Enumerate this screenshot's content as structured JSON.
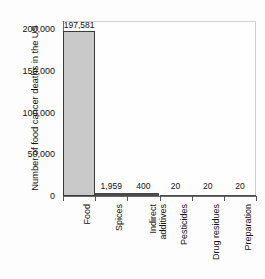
{
  "chart_data": {
    "type": "bar",
    "title": "",
    "subtitle": "",
    "xlabel": "",
    "ylabel": "Number of food cancer deaths in the US",
    "categories": [
      "Food",
      "Spices",
      "Indirect additives",
      "Pesticides",
      "Drug residues",
      "Preparation"
    ],
    "values": [
      197581,
      1959,
      400,
      20,
      20,
      20
    ],
    "value_labels": [
      "197,581",
      "1,959",
      "400",
      "20",
      "20",
      "20"
    ],
    "ylim": [
      0,
      210000
    ],
    "yticks": [
      0,
      50000,
      100000,
      150000,
      200000
    ],
    "ytick_labels": [
      "0",
      "50,000",
      "100,000",
      "150,000",
      "200,000"
    ],
    "grid": false,
    "legend": "none",
    "colors": {
      "bar_fill": "#c9c9c9",
      "bar_edge": "#3a3a3a",
      "thin_bar": "#4a4a4a",
      "axis": "#6a6a6a",
      "plot_border": "#cfcfcf",
      "text": "#111111",
      "background": "#fdfdfd"
    }
  },
  "axis": {
    "y_title": "Number of food cancer deaths in the US"
  },
  "category_label_lines": [
    [
      "Food"
    ],
    [
      "Spices"
    ],
    [
      "Indirect",
      "additives"
    ],
    [
      "Pesticides"
    ],
    [
      "Drug residues"
    ],
    [
      "Preparation"
    ]
  ]
}
